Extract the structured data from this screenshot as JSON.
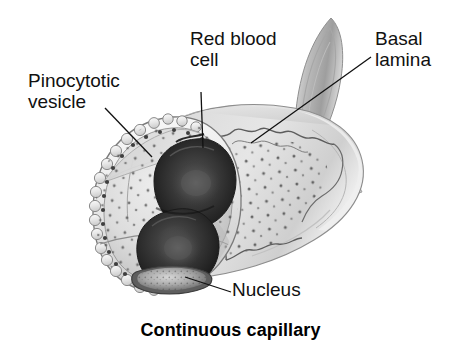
{
  "figure": {
    "caption": "Continuous capillary",
    "type": "anatomical-illustration",
    "background_color": "#ffffff",
    "ink_color": "#111111"
  },
  "labels": {
    "pinocytotic_vesicle": "Pinocytotic\nvesicle",
    "red_blood_cell": "Red blood\ncell",
    "basal_lamina": "Basal\nlamina",
    "nucleus": "Nucleus"
  },
  "leader_lines": [
    {
      "name": "pinocytotic-vesicle-leader",
      "x1": 105,
      "y1": 108,
      "x2": 152,
      "y2": 157
    },
    {
      "name": "red-blood-cell-leader",
      "x1": 201,
      "y1": 92,
      "x2": 203,
      "y2": 148
    },
    {
      "name": "basal-lamina-leader",
      "x1": 371,
      "y1": 57,
      "x2": 251,
      "y2": 143
    },
    {
      "name": "nucleus-leader",
      "x1": 231,
      "y1": 292,
      "x2": 185,
      "y2": 277
    }
  ],
  "structures": [
    {
      "name": "endothelial-cell-wall",
      "fill": "#cfcfcf"
    },
    {
      "name": "capillary-lumen",
      "fill": "#d8d8d8"
    },
    {
      "name": "red-blood-cell-upper",
      "fill": "#3a3a3a"
    },
    {
      "name": "red-blood-cell-lower",
      "fill": "#3a3a3a"
    },
    {
      "name": "endothelial-nucleus",
      "fill": "#9a9a9a"
    },
    {
      "name": "basal-lamina-sheet",
      "fill": "#c4c4c4"
    },
    {
      "name": "pinocytotic-vesicles",
      "fill": "#555555"
    }
  ]
}
